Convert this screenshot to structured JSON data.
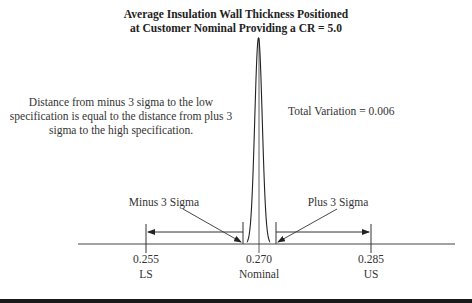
{
  "title": {
    "line1": "Average Insulation Wall Thickness Positioned",
    "line2": "at Customer Nominal Providing a CR = 5.0"
  },
  "annotations": {
    "left_note": "Distance from minus 3 sigma to the low specification is equal to the distance from plus 3 sigma to the high specification.",
    "total_variation": "Total Variation = 0.006",
    "minus_sigma": "Minus 3 Sigma",
    "plus_sigma": "Plus 3 Sigma"
  },
  "axis": {
    "ticks": [
      {
        "value": "0.255",
        "label": "LS"
      },
      {
        "value": "0.270",
        "label": "Nominal"
      },
      {
        "value": "0.285",
        "label": "US"
      }
    ]
  },
  "chart_data": {
    "type": "distribution",
    "title": "Average Insulation Wall Thickness Positioned at Customer Nominal Providing a CR = 5.0",
    "lower_spec": 0.255,
    "nominal": 0.27,
    "upper_spec": 0.285,
    "mean": 0.27,
    "minus_3_sigma": 0.2685,
    "plus_3_sigma": 0.2715,
    "total_variation": 0.006,
    "capability_ratio": 5.0
  }
}
